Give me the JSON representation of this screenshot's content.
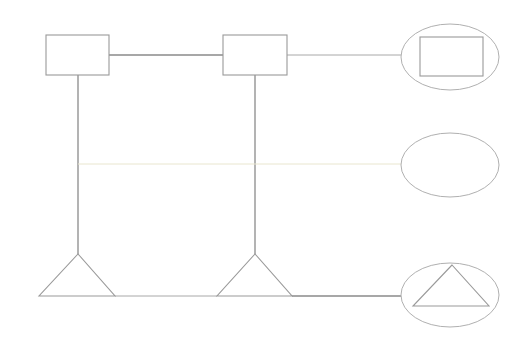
{
  "diagram": {
    "width": 532,
    "height": 342,
    "background": "#ffffff",
    "colors": {
      "strong_line": "#8a8a8a",
      "medium_line": "#a8a8a8",
      "faint_line": "#e9e6cf",
      "shape_stroke": "#9a9a9a",
      "ellipse_stroke": "#b0b0b0"
    },
    "nodes": [
      {
        "id": "box-1",
        "shape": "rectangle",
        "x": 46,
        "y": 35,
        "w": 63,
        "h": 40
      },
      {
        "id": "box-2",
        "shape": "rectangle",
        "x": 223,
        "y": 35,
        "w": 64,
        "h": 40
      },
      {
        "id": "triangle-1",
        "shape": "triangle",
        "points": [
          [
            78,
            254
          ],
          [
            39,
            296
          ],
          [
            115,
            296
          ]
        ]
      },
      {
        "id": "triangle-2",
        "shape": "triangle",
        "points": [
          [
            255,
            254
          ],
          [
            217,
            296
          ],
          [
            292,
            296
          ]
        ]
      },
      {
        "id": "ellipse-1",
        "shape": "ellipse",
        "cx": 450,
        "cy": 57,
        "rx": 49,
        "ry": 33,
        "inner": {
          "shape": "rectangle",
          "x": 420,
          "y": 37,
          "w": 63,
          "h": 39
        }
      },
      {
        "id": "ellipse-2",
        "shape": "ellipse",
        "cx": 450,
        "cy": 165,
        "rx": 49,
        "ry": 32
      },
      {
        "id": "ellipse-3",
        "shape": "ellipse",
        "cx": 450,
        "cy": 295,
        "rx": 49,
        "ry": 32,
        "inner": {
          "shape": "triangle",
          "points": [
            [
              452,
              265
            ],
            [
              413,
              306
            ],
            [
              489,
              306
            ]
          ]
        }
      }
    ],
    "edges": [
      {
        "id": "box1-box2",
        "x1": 109,
        "y1": 55,
        "x2": 223,
        "y2": 55,
        "style": "strong"
      },
      {
        "id": "box2-ellipse1",
        "x1": 287,
        "y1": 55,
        "x2": 401,
        "y2": 55,
        "style": "faint-grey"
      },
      {
        "id": "box1-triangle1",
        "x1": 78,
        "y1": 75,
        "x2": 78,
        "y2": 254,
        "style": "strong"
      },
      {
        "id": "box2-triangle2",
        "x1": 255,
        "y1": 75,
        "x2": 255,
        "y2": 254,
        "style": "strong"
      },
      {
        "id": "middle-line",
        "x1": 78,
        "y1": 164,
        "x2": 401,
        "y2": 164,
        "style": "faint"
      },
      {
        "id": "triangle1-triangle2",
        "x1": 115,
        "y1": 296,
        "x2": 217,
        "y2": 296,
        "style": "faint-grey"
      },
      {
        "id": "triangle2-ellipse3",
        "x1": 292,
        "y1": 296,
        "x2": 401,
        "y2": 296,
        "style": "strong"
      }
    ]
  }
}
